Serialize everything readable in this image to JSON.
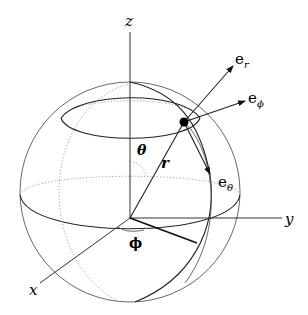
{
  "diagram": {
    "axes": {
      "z": "z",
      "y": "y",
      "x": "x"
    },
    "angles": {
      "theta": "θ",
      "phi": "ϕ"
    },
    "radius_label": "r",
    "unit_vectors": {
      "e_r": {
        "base": "e",
        "sub": "r"
      },
      "e_phi": {
        "base": "e",
        "sub": "ϕ"
      },
      "e_theta": {
        "base": "e",
        "sub": "θ"
      }
    },
    "colors": {
      "line": "#333333",
      "dotted": "#999999",
      "point": "#000000"
    }
  }
}
